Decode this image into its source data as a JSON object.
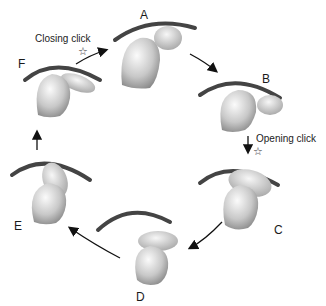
{
  "diagram": {
    "type": "cycle",
    "stages": [
      {
        "id": "A",
        "label": "A"
      },
      {
        "id": "B",
        "label": "B"
      },
      {
        "id": "C",
        "label": "C"
      },
      {
        "id": "D",
        "label": "D"
      },
      {
        "id": "E",
        "label": "E"
      },
      {
        "id": "F",
        "label": "F"
      }
    ],
    "annotations": {
      "closing_click": "Closing click",
      "opening_click": "Opening click",
      "star_symbol": "☆"
    },
    "flow": [
      "F→A",
      "A→B",
      "B→C",
      "C→D",
      "D→E",
      "E→F"
    ],
    "colors": {
      "line": "#222222",
      "shape_light": "#f2f2f2",
      "shape_dark": "#9a9a9a"
    }
  }
}
